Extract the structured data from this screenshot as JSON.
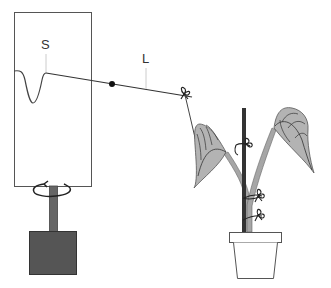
{
  "diagram": {
    "labels": {
      "stylus": "S",
      "lever": "L"
    },
    "components": [
      {
        "id": "recording-drum",
        "description": "Rotating drum with trace"
      },
      {
        "id": "stylus-tip",
        "label": "S"
      },
      {
        "id": "lever-arm",
        "label": "L"
      },
      {
        "id": "pivot-point",
        "description": "Lever fulcrum (black dot)"
      },
      {
        "id": "thread",
        "description": "Thread from lever to plant"
      },
      {
        "id": "drive-shaft",
        "description": "Rotating shaft"
      },
      {
        "id": "rotation-arrow",
        "description": "Circular arrow indicating rotation"
      },
      {
        "id": "motor-base",
        "description": "Dark base box / clockwork"
      },
      {
        "id": "plant",
        "description": "Twining plant with two leaves"
      },
      {
        "id": "support-stake",
        "description": "Dark vertical stake"
      },
      {
        "id": "ties",
        "count": 4
      },
      {
        "id": "flower-pot"
      }
    ],
    "colors": {
      "outline": "#444444",
      "leaf_fill": "#b3b3b3",
      "stem_fill": "#a6a6a6",
      "base_fill": "#555555",
      "shaft_fill": "#666666",
      "stake": "#333333",
      "label_tick": "#cccccc"
    }
  }
}
